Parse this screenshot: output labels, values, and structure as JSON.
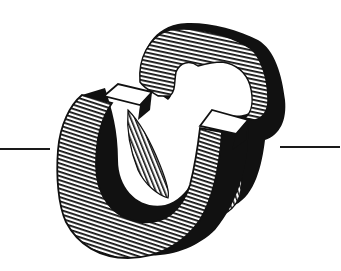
{
  "illustration": {
    "subject": "two interlocking horseshoe magnets",
    "style": "black-and-white hatched line art",
    "colors": {
      "ink": "#111111",
      "paper": "#ffffff"
    },
    "elements": [
      {
        "name": "back-magnet",
        "fill": "horizontal-hatch",
        "outline": "thick-black-shadow"
      },
      {
        "name": "front-magnet",
        "fill": "horizontal-hatch",
        "inner": "diagonal-hatch",
        "pole-caps": "white"
      },
      {
        "name": "left-rule"
      },
      {
        "name": "right-rule"
      }
    ]
  }
}
